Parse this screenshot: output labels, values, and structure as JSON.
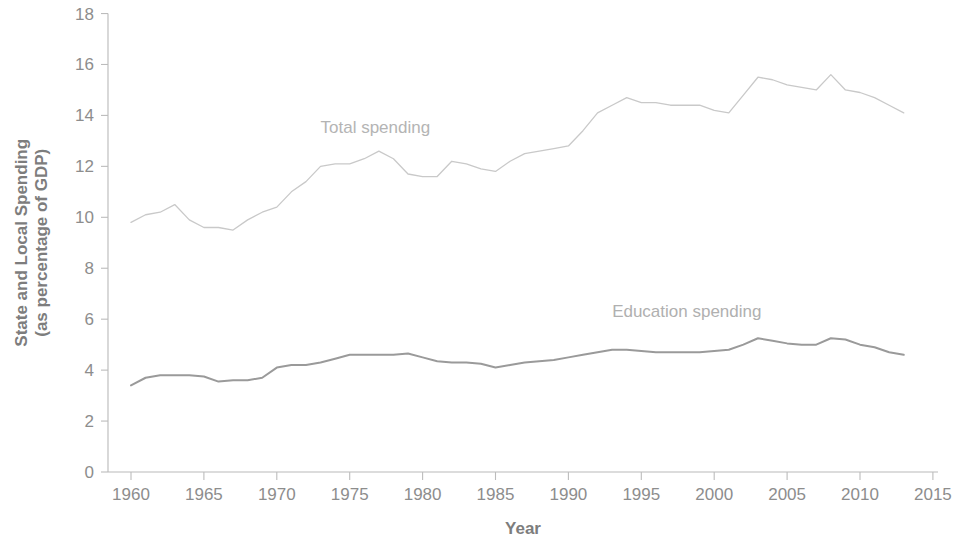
{
  "chart_data": {
    "type": "line",
    "title": "",
    "xlabel": "Year",
    "ylabel": "State and Local Spending (as percentage of GDP)",
    "ylabel_line1": "State and Local Spending",
    "ylabel_line2": "(as percentage of GDP)",
    "xlim": [
      1958,
      2015
    ],
    "ylim": [
      0,
      18
    ],
    "grid": false,
    "legend_position": "inline-annotations",
    "x_ticks": [
      1960,
      1965,
      1970,
      1975,
      1980,
      1985,
      1990,
      1995,
      2000,
      2005,
      2010,
      2015
    ],
    "x_tick_labels": [
      "1960",
      "1965",
      "1970",
      "1975",
      "1980",
      "1985",
      "1990",
      "1995",
      "2000",
      "2005",
      "2010",
      "2015"
    ],
    "y_ticks": [
      0,
      2,
      4,
      6,
      8,
      10,
      12,
      14,
      16,
      18
    ],
    "y_tick_labels": [
      "0",
      "2",
      "4",
      "6",
      "8",
      "10",
      "12",
      "14",
      "16",
      "18"
    ],
    "x": [
      1960,
      1961,
      1962,
      1963,
      1964,
      1965,
      1966,
      1967,
      1968,
      1969,
      1970,
      1971,
      1972,
      1973,
      1974,
      1975,
      1976,
      1977,
      1978,
      1979,
      1980,
      1981,
      1982,
      1983,
      1984,
      1985,
      1986,
      1987,
      1988,
      1989,
      1990,
      1991,
      1992,
      1993,
      1994,
      1995,
      1996,
      1997,
      1998,
      1999,
      2000,
      2001,
      2002,
      2003,
      2004,
      2005,
      2006,
      2007,
      2008,
      2009,
      2010,
      2011,
      2012,
      2013
    ],
    "series": [
      {
        "name": "Total spending",
        "color": "#c9c9c9",
        "label_x": 1973,
        "label_y": 13.3,
        "values": [
          9.8,
          10.1,
          10.2,
          10.5,
          9.9,
          9.6,
          9.6,
          9.5,
          9.9,
          10.2,
          10.4,
          11.0,
          11.4,
          12.0,
          12.1,
          12.1,
          12.3,
          12.6,
          12.3,
          11.7,
          11.6,
          11.6,
          12.2,
          12.1,
          11.9,
          11.8,
          12.2,
          12.5,
          12.6,
          12.7,
          12.8,
          13.4,
          14.1,
          14.4,
          14.7,
          14.5,
          14.5,
          14.4,
          14.4,
          14.4,
          14.2,
          14.1,
          14.8,
          15.5,
          15.4,
          15.2,
          15.1,
          15.0,
          15.6,
          15.0,
          14.9,
          14.7,
          14.4,
          14.1
        ]
      },
      {
        "name": "Education spending",
        "color": "#9a9a9a",
        "label_x": 1993,
        "label_y": 6.1,
        "values": [
          3.4,
          3.7,
          3.8,
          3.8,
          3.8,
          3.75,
          3.55,
          3.6,
          3.6,
          3.7,
          4.1,
          4.2,
          4.2,
          4.3,
          4.45,
          4.6,
          4.6,
          4.6,
          4.6,
          4.65,
          4.5,
          4.35,
          4.3,
          4.3,
          4.25,
          4.1,
          4.2,
          4.3,
          4.35,
          4.4,
          4.5,
          4.6,
          4.7,
          4.8,
          4.8,
          4.75,
          4.7,
          4.7,
          4.7,
          4.7,
          4.75,
          4.8,
          5.0,
          5.25,
          5.15,
          5.05,
          5.0,
          5.0,
          5.25,
          5.2,
          5.0,
          4.9,
          4.7,
          4.6
        ]
      }
    ]
  },
  "axes": {
    "x_title": "Year",
    "y_title_line1": "State and Local Spending",
    "y_title_line2": "(as percentage of GDP)"
  },
  "annotations": {
    "total": "Total spending",
    "education": "Education spending"
  },
  "colors": {
    "total_line": "#c9c9c9",
    "education_line": "#9a9a9a",
    "axis": "#b9b9b9",
    "tick_text": "#8d8d8d",
    "title_text": "#7d7d7d",
    "background": "#ffffff"
  }
}
